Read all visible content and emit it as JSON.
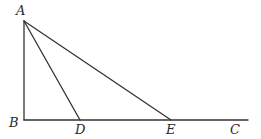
{
  "diagram": {
    "type": "geometry-triangle",
    "points": {
      "A": {
        "x": 24,
        "y": 21
      },
      "B": {
        "x": 24,
        "y": 120
      },
      "D": {
        "x": 80,
        "y": 120
      },
      "E": {
        "x": 171,
        "y": 120
      },
      "C": {
        "x": 248,
        "y": 120
      }
    },
    "segments": [
      {
        "name": "AB",
        "from": "A",
        "to": "B"
      },
      {
        "name": "BC",
        "from": "B",
        "to": "C"
      },
      {
        "name": "AD",
        "from": "A",
        "to": "D"
      },
      {
        "name": "AE",
        "from": "A",
        "to": "E"
      }
    ],
    "labels": {
      "A": {
        "text": "A",
        "x": 16,
        "y": 15
      },
      "B": {
        "text": "B",
        "x": 9,
        "y": 127
      },
      "D": {
        "text": "D",
        "x": 75,
        "y": 134
      },
      "E": {
        "text": "E",
        "x": 166,
        "y": 134
      },
      "C": {
        "text": "C",
        "x": 230,
        "y": 134
      }
    },
    "stroke_color": "#333333",
    "label_color": "#2a2a2a"
  }
}
